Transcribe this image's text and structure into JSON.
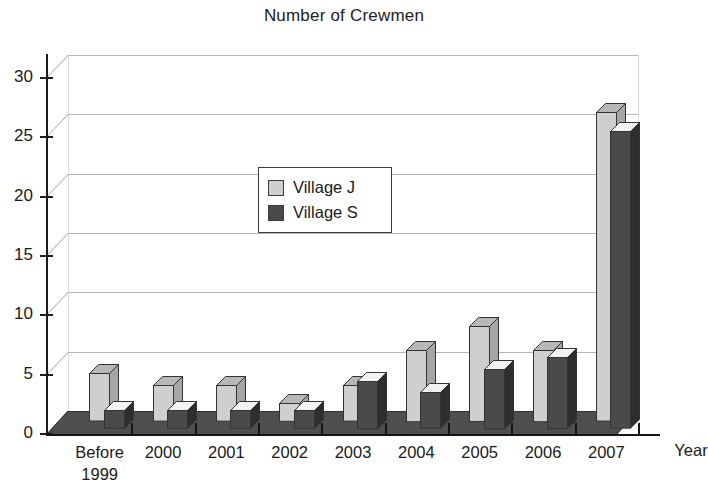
{
  "chart_data": {
    "type": "bar",
    "title": "Number of Crewmen",
    "xlabel": "Year",
    "ylabel": "",
    "categories": [
      "Before 1999",
      "2000",
      "2001",
      "2002",
      "2003",
      "2004",
      "2005",
      "2006",
      "2007"
    ],
    "series": [
      {
        "name": "Village J",
        "color": "#cfcfcf",
        "values": [
          4,
          3,
          3,
          1.5,
          3,
          6,
          8,
          6,
          26
        ]
      },
      {
        "name": "Village S",
        "color": "#4a4a4a",
        "values": [
          1.5,
          1.5,
          1.5,
          1.5,
          4,
          3,
          5,
          6,
          25
        ]
      }
    ],
    "ylim": [
      0,
      30
    ],
    "yticks": [
      0,
      5,
      10,
      15,
      20,
      25,
      30
    ],
    "ytick_labels": [
      "0",
      "5",
      "10",
      "15",
      "20",
      "25",
      "30"
    ],
    "grid": true,
    "legend_position": "upper-center-left",
    "style": "3d-clustered-column",
    "colors": {
      "village_j": "#cfcfcf",
      "village_j_top": "#b7b7b7",
      "village_j_side": "#a6a6a6",
      "village_s": "#4a4a4a",
      "village_s_top": "#f2f2f2",
      "village_s_side": "#2e2e2e",
      "floor": "#4f4f4f",
      "floor_edge": "#151515",
      "axis": "#151515",
      "gridline": "#b6b6b6"
    }
  },
  "axis": {
    "x_title": "Year",
    "x_labels": [
      {
        "line1": "Before",
        "line2": "1999"
      },
      {
        "line1": "2000",
        "line2": ""
      },
      {
        "line1": "2001",
        "line2": ""
      },
      {
        "line1": "2002",
        "line2": ""
      },
      {
        "line1": "2003",
        "line2": ""
      },
      {
        "line1": "2004",
        "line2": ""
      },
      {
        "line1": "2005",
        "line2": ""
      },
      {
        "line1": "2006",
        "line2": ""
      },
      {
        "line1": "2007",
        "line2": ""
      }
    ],
    "y_labels": [
      "30",
      "25",
      "20",
      "15",
      "10",
      "5",
      "0"
    ]
  },
  "legend": {
    "items": [
      {
        "label": "Village J",
        "color": "#cfcfcf"
      },
      {
        "label": "Village S",
        "color": "#4a4a4a"
      }
    ]
  }
}
